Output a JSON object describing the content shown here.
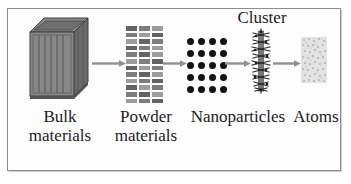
{
  "figure": {
    "title_absent": true,
    "background_color": "#ffffff",
    "frame_color": "#8d8d8d",
    "theme": "grayscale scientific schematic"
  },
  "stages": [
    {
      "id": "bulk",
      "label": "Bulk\nmaterials",
      "icon": "bulk-box-3d-icon",
      "color": "#7e7e7e",
      "description": "three-dimensional shaded crate with vertical slats"
    },
    {
      "id": "powder",
      "label": "Powder\nmaterials",
      "icon": "powder-grid-icon",
      "color": "#7d7d7d",
      "description": "dense grid of small rectangles in three columns"
    },
    {
      "id": "nanoparticles",
      "label": "Nanoparticles",
      "icon": "nanoparticle-dots-icon",
      "color": "#131313",
      "description": "array of black circular dots, four columns by five rows"
    },
    {
      "id": "cluster",
      "label": "Cluster",
      "icon": "cluster-fuzz-icon",
      "color": "#2a2a2a",
      "description": "narrow vertical spiky fuzzy column"
    },
    {
      "id": "atoms",
      "label": "Atoms",
      "icon": "atoms-speckle-icon",
      "color": "#c8c8c8",
      "description": "very light gray speckled rectangle"
    }
  ],
  "arrows": [
    {
      "id": "arrow-bulk-to-powder",
      "from": "bulk",
      "to": "powder",
      "color": "#909090"
    },
    {
      "id": "arrow-powder-to-nano",
      "from": "powder",
      "to": "nanoparticles",
      "color": "#909090"
    },
    {
      "id": "arrow-nano-to-cluster",
      "from": "nanoparticles",
      "to": "cluster",
      "color": "#909090"
    },
    {
      "id": "arrow-cluster-to-atoms",
      "from": "cluster",
      "to": "atoms",
      "color": "#909090"
    }
  ],
  "labels": {
    "bulk": "Bulk\nmaterials",
    "powder": "Powder\nmaterials",
    "nanoparticles": "Nanoparticles",
    "cluster": "Cluster",
    "atoms": "Atoms"
  }
}
